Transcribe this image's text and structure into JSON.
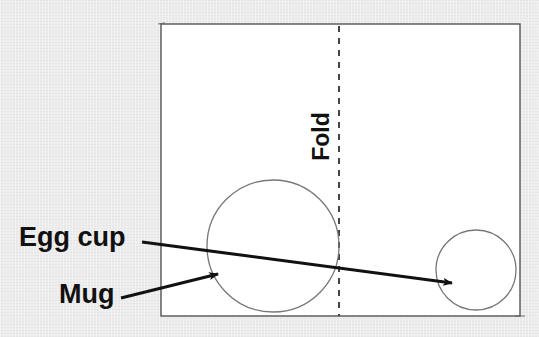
{
  "diagram": {
    "labels": {
      "egg_cup": "Egg cup",
      "mug": "Mug",
      "fold": "Fold"
    },
    "colors": {
      "background": "#ececec",
      "paper": "#ffffff",
      "pencil_line": "#555555",
      "arrow": "#111111",
      "text": "#111111"
    },
    "shapes": {
      "paper_rect": {
        "x1": 161,
        "y1": 24,
        "x2": 520,
        "y2": 316
      },
      "fold_line_x": 339,
      "mug_circle": {
        "cx": 273,
        "cy": 246,
        "r": 66
      },
      "egg_cup_circle": {
        "cx": 476,
        "cy": 270,
        "r": 40
      }
    },
    "arrows": [
      {
        "name": "egg-cup-arrow",
        "from": [
          142,
          242
        ],
        "to": [
          452,
          283
        ]
      },
      {
        "name": "mug-arrow",
        "from": [
          121,
          298
        ],
        "to": [
          218,
          274
        ]
      }
    ]
  }
}
